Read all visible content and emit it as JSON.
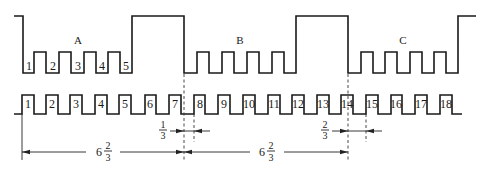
{
  "diagram": {
    "type": "timing-diagram",
    "colors": {
      "stroke": "#1a1a1a",
      "background": "#ffffff"
    },
    "top_waveform": {
      "segments": [
        {
          "label": "A",
          "pulse_labels": [
            "1",
            "2",
            "3",
            "4",
            "5"
          ]
        },
        {
          "label": "B",
          "pulse_labels": []
        },
        {
          "label": "C",
          "pulse_labels": []
        }
      ],
      "levels": {
        "high": "high",
        "mid": "pulse",
        "low": "low"
      }
    },
    "bottom_waveform": {
      "pulse_labels": [
        "1",
        "2",
        "3",
        "4",
        "5",
        "6",
        "7",
        "8",
        "9",
        "10",
        "11",
        "12",
        "13",
        "14",
        "15",
        "16",
        "17",
        "18"
      ]
    },
    "dimensions": {
      "offset_1": {
        "whole": "",
        "num": "1",
        "den": "3"
      },
      "offset_2": {
        "whole": "",
        "num": "2",
        "den": "3"
      },
      "period_1": {
        "whole": "6",
        "num": "2",
        "den": "3"
      },
      "period_2": {
        "whole": "6",
        "num": "2",
        "den": "3"
      }
    }
  }
}
